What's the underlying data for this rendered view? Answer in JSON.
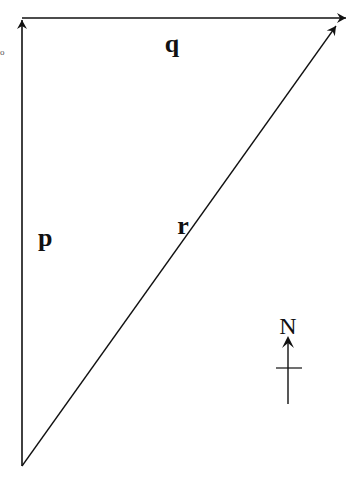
{
  "diagram": {
    "type": "vector-triangle",
    "vectors": [
      {
        "name": "p",
        "label": "p",
        "from": [
          22,
          466
        ],
        "to": [
          22,
          18
        ],
        "direction": "north"
      },
      {
        "name": "q",
        "label": "q",
        "from": [
          22,
          18
        ],
        "to": [
          345,
          18
        ],
        "direction": "east"
      },
      {
        "name": "r",
        "label": "r",
        "from": [
          22,
          466
        ],
        "to": [
          334,
          27
        ],
        "direction": "north-east"
      }
    ],
    "compass": {
      "label": "N"
    },
    "stray_mark": "o",
    "colors": {
      "stroke": "#111111",
      "background": "#ffffff"
    }
  }
}
